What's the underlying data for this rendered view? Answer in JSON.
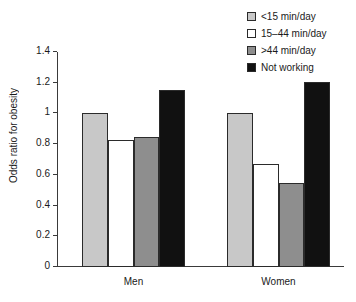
{
  "chart_data": {
    "type": "bar",
    "title": "",
    "subtitle": "",
    "xlabel": "",
    "ylabel": "Odds ratio for obesity",
    "categories": [
      "Men",
      "Women"
    ],
    "series": [
      {
        "name": "<15 min/day",
        "color": "#c8c8c8",
        "values": [
          1.0,
          1.0
        ]
      },
      {
        "name": "15–44 min/day",
        "color": "#ffffff",
        "values": [
          0.83,
          0.67
        ]
      },
      {
        "name": ">44 min/day",
        "color": "#8e8e8e",
        "values": [
          0.845,
          0.545
        ]
      },
      {
        "name": "Not working",
        "color": "#111111",
        "values": [
          1.15,
          1.205
        ]
      }
    ],
    "ylim": [
      0,
      1.4
    ],
    "yticks": [
      0,
      0.2,
      0.4,
      0.6,
      0.8,
      1.0,
      1.2,
      1.4
    ],
    "ytick_labels": [
      "0",
      "0.2",
      "0.4",
      "0.6",
      "0.8",
      "1",
      "1.2",
      "1.4"
    ],
    "grid": false,
    "legend_position": "top-right"
  },
  "legend": {
    "items": [
      {
        "label": "<15 min/day",
        "color": "#c8c8c8"
      },
      {
        "label": "15–44 min/day",
        "color": "#ffffff"
      },
      {
        "label": ">44 min/day",
        "color": "#8e8e8e"
      },
      {
        "label": "Not working",
        "color": "#111111"
      }
    ]
  },
  "axes": {
    "y_title": "Odds ratio for obesity",
    "y_ticks": [
      "1.4",
      "1.2",
      "1",
      "0.8",
      "0.6",
      "0.4",
      "0.2",
      "0"
    ],
    "x_categories": [
      "Men",
      "Women"
    ]
  }
}
